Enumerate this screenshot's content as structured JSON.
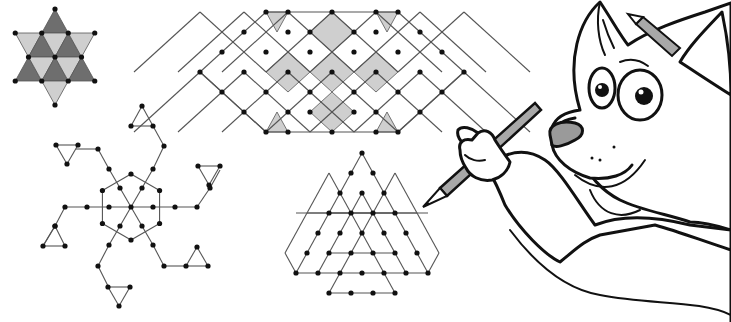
{
  "colors": {
    "background": "#ffffff",
    "dot": "#111111",
    "edge": "#555555",
    "shade_dark": "#6e6e6e",
    "shade_light": "#cfcfcf",
    "pencil": "#a8a8a8",
    "nose": "#9a9a9a"
  },
  "figures": [
    {
      "id": "star-of-david-triangles",
      "description": "Six-pointed star subdivided into 12 small triangles, alternately dark and light grey"
    },
    {
      "id": "hexagonal-rhombus-lattice",
      "description": "Hexagon-shaped dot lattice of rhombi with shaded rhombi and triangles"
    },
    {
      "id": "spiral-pinwheel",
      "description": "Central hexagon with six spiral arms ending in small triangles"
    },
    {
      "id": "nested-triangles",
      "description": "Overlapping triangular dot grids forming a star of triangles"
    },
    {
      "id": "wolf-mascot",
      "description": "Cartoon wolf holding a pencil, pencil behind ear"
    }
  ]
}
